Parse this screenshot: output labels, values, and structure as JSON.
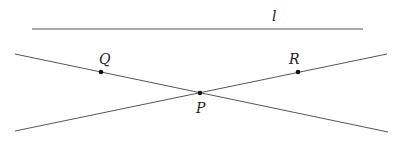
{
  "diagram": {
    "title": "",
    "colors": {
      "line": "#555555",
      "point": "#111111",
      "label": "#222222"
    },
    "lines": [
      {
        "id": "l",
        "label": "l",
        "x1": 32,
        "y1": 29,
        "x2": 363,
        "y2": 29
      },
      {
        "id": "QP",
        "label": "",
        "x1": 15,
        "y1": 54,
        "x2": 388,
        "y2": 132
      },
      {
        "id": "RP",
        "label": "",
        "x1": 15,
        "y1": 131,
        "x2": 387,
        "y2": 54
      }
    ],
    "points": [
      {
        "id": "Q",
        "label": "Q",
        "x": 101,
        "y": 72
      },
      {
        "id": "R",
        "label": "R",
        "x": 298,
        "y": 72
      },
      {
        "id": "P",
        "label": "P",
        "x": 200,
        "y": 93
      }
    ],
    "labels": {
      "l": "l",
      "Q": "Q",
      "R": "R",
      "P": "P"
    }
  }
}
